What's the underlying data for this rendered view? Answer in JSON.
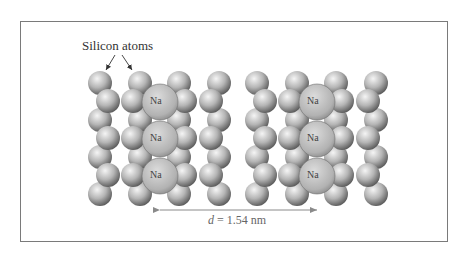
{
  "diagram": {
    "label_silicon": "Silicon atoms",
    "na_label": "Na",
    "distance_var": "d",
    "distance_value": "= 1.54 nm",
    "colors": {
      "frame": "#7a7a7a",
      "arrow": "#8a8a8a",
      "si_light": "#f2f2f2",
      "si_dark": "#6a6a6a",
      "na_fill": "#bdbdbd"
    }
  }
}
